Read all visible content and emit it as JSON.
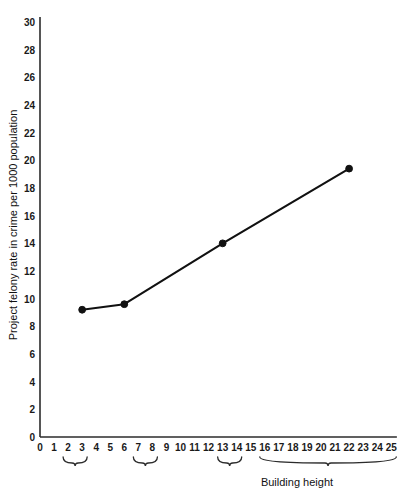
{
  "chart_data": {
    "type": "line",
    "title": "",
    "xlabel": "Building height",
    "ylabel": "Project felony rate in crime per 1000 population",
    "xlim": [
      0,
      25
    ],
    "ylim": [
      0,
      30
    ],
    "grid": false,
    "legend": "none",
    "x_ticks": [
      0,
      1,
      2,
      3,
      4,
      5,
      6,
      7,
      8,
      9,
      10,
      11,
      12,
      13,
      14,
      15,
      16,
      17,
      18,
      19,
      20,
      21,
      22,
      23,
      24,
      25
    ],
    "y_ticks": [
      0,
      2,
      4,
      6,
      8,
      10,
      12,
      14,
      16,
      18,
      20,
      22,
      24,
      26,
      28,
      30
    ],
    "x": [
      3,
      6,
      13,
      22
    ],
    "values": [
      9.2,
      9.6,
      14.0,
      19.4
    ],
    "marker": "filled-circle",
    "x_group_braces": [
      {
        "from": 2,
        "to": 3,
        "label": ""
      },
      {
        "from": 7,
        "to": 8,
        "label": ""
      },
      {
        "from": 13,
        "to": 14,
        "label": ""
      },
      {
        "from": 16,
        "to": 25,
        "label": ""
      }
    ],
    "line_color": "#111111",
    "axis_color": "#2b2b2b",
    "background": "#ffffff"
  },
  "axis": {
    "y_label": "Project felony rate in crime per 1000 population",
    "x_label": "Building height",
    "y_tick_labels": [
      "0",
      "2",
      "4",
      "6",
      "8",
      "10",
      "12",
      "14",
      "16",
      "18",
      "20",
      "22",
      "24",
      "26",
      "28",
      "30"
    ],
    "x_tick_labels": [
      "0",
      "1",
      "2",
      "3",
      "4",
      "5",
      "6",
      "7",
      "8",
      "9",
      "10",
      "11",
      "12",
      "13",
      "14",
      "15",
      "16",
      "17",
      "18",
      "19",
      "20",
      "21",
      "22",
      "23",
      "24",
      "25"
    ]
  }
}
